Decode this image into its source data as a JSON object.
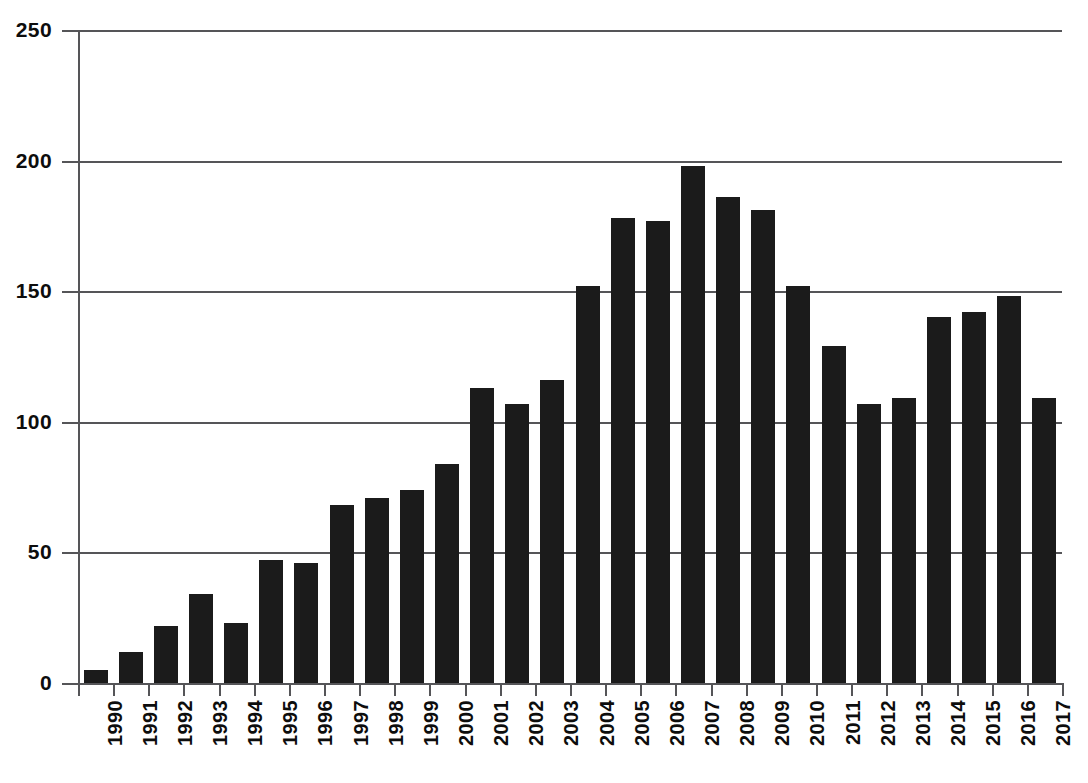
{
  "chart_data": {
    "type": "bar",
    "title": "",
    "subtitle": "",
    "xlabel": "",
    "ylabel": "",
    "ylim": [
      0,
      250
    ],
    "y_ticks": [
      0,
      50,
      100,
      150,
      200,
      250
    ],
    "grid": true,
    "legend": null,
    "bar_color": "#1b1b1b",
    "axis_color": "#555558",
    "background": "#ffffff",
    "categories": [
      "1990",
      "1991",
      "1992",
      "1993",
      "1994",
      "1995",
      "1996",
      "1997",
      "1998",
      "1999",
      "2000",
      "2001",
      "2002",
      "2003",
      "2004",
      "2005",
      "2006",
      "2007",
      "2008",
      "2009",
      "2010",
      "2011",
      "2012",
      "2013",
      "2014",
      "2015",
      "2016",
      "2017"
    ],
    "values": [
      5,
      12,
      22,
      34,
      23,
      47,
      46,
      68,
      71,
      74,
      84,
      113,
      107,
      116,
      152,
      178,
      177,
      198,
      186,
      181,
      152,
      129,
      107,
      109,
      140,
      142,
      148,
      109
    ]
  }
}
